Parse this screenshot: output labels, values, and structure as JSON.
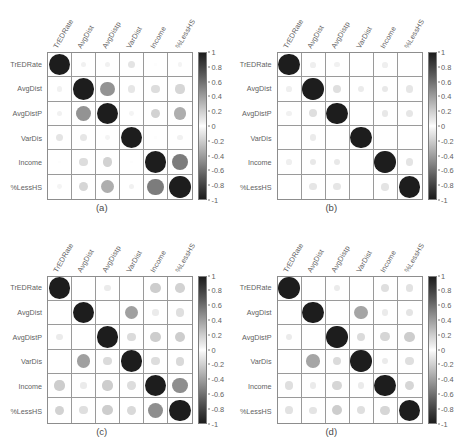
{
  "figure": {
    "kind": "correlation-matrix-panels",
    "panel_count": 4
  },
  "variables": [
    "TrEDRate",
    "AvgDist",
    "AvgDistP",
    "VarDist",
    "Income",
    "%LessHS"
  ],
  "row_labels": [
    "TrEDRate",
    "AvgDist",
    "AvgDistP",
    "VarDis",
    "Income",
    "%LessHS"
  ],
  "col_labels": [
    "TrEDRate",
    "AvgDist",
    "AvgDistp",
    "VarDist",
    "Income",
    "%LessHS"
  ],
  "colorbar": {
    "ticks": [
      "1",
      "0.8",
      "0.6",
      "0.4",
      "0.2",
      "0",
      "-0.2",
      "-0.4",
      "-0.6",
      "-0.8",
      "-1"
    ],
    "min": -1,
    "max": 1,
    "colormap": "gray-diverging",
    "high_color": "#1d1d1d",
    "mid_color": "#ffffff",
    "low_color": "#1d1d1d"
  },
  "captions": [
    "(a)",
    "(b)",
    "(c)",
    "(d)"
  ],
  "chart_data": [
    {
      "type": "heatmap",
      "title": "(a)",
      "xlabel": "",
      "ylabel": "",
      "categories": [
        "TrEDRate",
        "AvgDist",
        "AvgDistP",
        "VarDist",
        "Income",
        "%LessHS"
      ],
      "zlim": [
        -1,
        1
      ],
      "grid": true,
      "legend": "right colorbar",
      "matrix": [
        [
          1.0,
          0.06,
          0.06,
          0.12,
          0.01,
          0.05
        ],
        [
          0.06,
          1.0,
          0.48,
          0.11,
          0.15,
          0.18
        ],
        [
          0.06,
          0.48,
          1.0,
          0.05,
          0.2,
          0.36
        ],
        [
          0.12,
          0.11,
          0.05,
          1.0,
          0.01,
          0.06
        ],
        [
          0.01,
          0.15,
          0.2,
          0.01,
          1.0,
          0.58
        ],
        [
          0.05,
          0.18,
          0.36,
          0.06,
          0.58,
          1.0
        ]
      ]
    },
    {
      "type": "heatmap",
      "title": "(b)",
      "xlabel": "",
      "ylabel": "",
      "categories": [
        "TrEDRate",
        "AvgDist",
        "AvgDistP",
        "VarDist",
        "Income",
        "%LessHS"
      ],
      "zlim": [
        -1,
        1
      ],
      "grid": true,
      "legend": "right colorbar",
      "matrix": [
        [
          1.0,
          0.07,
          0.06,
          0.0,
          0.07,
          0.0
        ],
        [
          0.07,
          1.0,
          0.14,
          0.09,
          0.1,
          0.11
        ],
        [
          0.06,
          0.14,
          1.0,
          0.0,
          0.1,
          0.11
        ],
        [
          0.0,
          0.09,
          0.0,
          1.0,
          0.0,
          0.0
        ],
        [
          0.07,
          0.1,
          0.1,
          0.0,
          1.0,
          0.12
        ],
        [
          0.0,
          0.11,
          0.11,
          0.0,
          0.12,
          1.0
        ]
      ]
    },
    {
      "type": "heatmap",
      "title": "(c)",
      "xlabel": "",
      "ylabel": "",
      "categories": [
        "TrEDRate",
        "AvgDist",
        "AvgDistP",
        "VarDist",
        "Income",
        "%LessHS"
      ],
      "zlim": [
        -1,
        1
      ],
      "grid": true,
      "legend": "right colorbar",
      "matrix": [
        [
          1.0,
          0.0,
          0.09,
          0.0,
          0.22,
          0.2
        ],
        [
          0.0,
          1.0,
          0.0,
          0.42,
          0.09,
          0.14
        ],
        [
          0.09,
          0.0,
          1.0,
          0.16,
          0.22,
          0.22
        ],
        [
          0.0,
          0.42,
          0.16,
          1.0,
          0.15,
          0.17
        ],
        [
          0.22,
          0.09,
          0.22,
          0.15,
          1.0,
          0.5
        ],
        [
          0.2,
          0.14,
          0.22,
          0.17,
          0.5,
          1.0
        ]
      ]
    },
    {
      "type": "heatmap",
      "title": "(d)",
      "xlabel": "",
      "ylabel": "",
      "categories": [
        "TrEDRate",
        "AvgDist",
        "AvgDistP",
        "VarDist",
        "Income",
        "%LessHS"
      ],
      "zlim": [
        -1,
        1
      ],
      "grid": true,
      "legend": "right colorbar",
      "matrix": [
        [
          1.0,
          0.0,
          0.09,
          0.0,
          0.14,
          0.13
        ],
        [
          0.0,
          1.0,
          0.0,
          0.4,
          0.09,
          0.12
        ],
        [
          0.09,
          0.0,
          1.0,
          0.16,
          0.18,
          0.22
        ],
        [
          0.0,
          0.4,
          0.16,
          1.0,
          0.09,
          0.14
        ],
        [
          0.14,
          0.09,
          0.18,
          0.09,
          1.0,
          0.18
        ],
        [
          0.13,
          0.12,
          0.22,
          0.14,
          0.18,
          1.0
        ]
      ]
    }
  ]
}
